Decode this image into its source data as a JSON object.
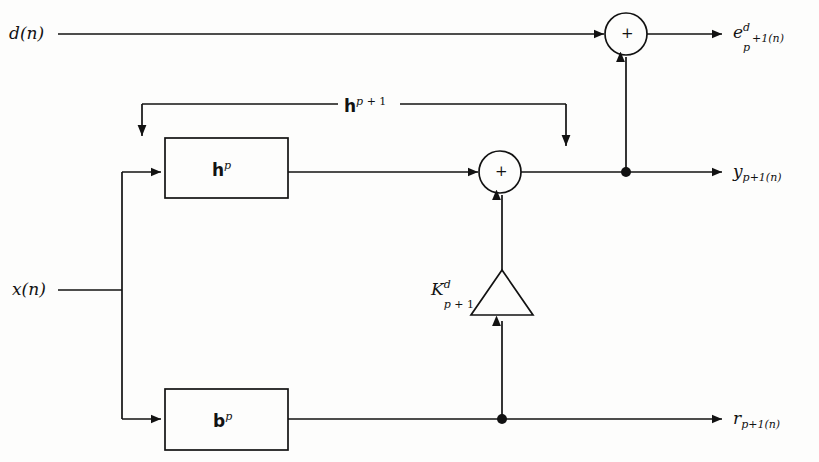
{
  "diagram": {
    "background_color": "#fdfdfc",
    "line_color": "#121212",
    "inputs": [
      {
        "id": "d",
        "label_text": "d(n)"
      },
      {
        "id": "x",
        "label_text": "x(n)"
      }
    ],
    "outputs": [
      {
        "id": "e",
        "label_text": "e^d_{p+1}(n)"
      },
      {
        "id": "y",
        "label_text": "y_{p+1}(n)"
      },
      {
        "id": "r",
        "label_text": "r_{p+1}(n)"
      }
    ],
    "blocks": [
      {
        "id": "h_block",
        "label_text": "h^p"
      },
      {
        "id": "b_block",
        "label_text": "b^p"
      }
    ],
    "gain": {
      "id": "k_gain",
      "label_text": "K^d_{p+1}"
    },
    "feedback": {
      "id": "h_update",
      "label_text": "h^{p+1}"
    },
    "adders": [
      {
        "id": "adder_error",
        "symbol": "+"
      },
      {
        "id": "adder_output",
        "symbol": "+"
      }
    ],
    "labels": {
      "input_d": "d(n)",
      "input_x": "x(n)",
      "output_e_base": "e",
      "output_e_sup": "d",
      "output_e_sub": "p",
      "output_e_tail": "+1(n)",
      "output_y_base": "y",
      "output_y_sub": "p",
      "output_y_tail": "+1(n)",
      "output_r_base": "r",
      "output_r_sub": "p",
      "output_r_tail": "+1(n)",
      "block_h_base": "h",
      "block_h_sup": "p",
      "block_b_base": "b",
      "block_b_sup": "p",
      "feedback_h_base": "h",
      "feedback_h_sup": "p",
      "feedback_h_sup_tail": " + 1",
      "gain_k_base": "K",
      "gain_k_sup": "d",
      "gain_k_sub": "p",
      "gain_k_sub_tail": " + 1",
      "adder_symbol": "+"
    }
  }
}
